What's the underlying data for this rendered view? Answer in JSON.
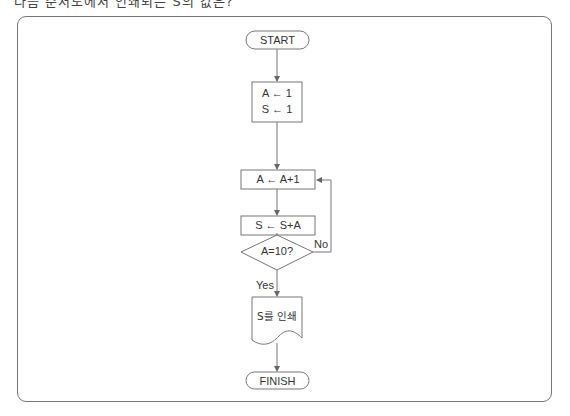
{
  "header": {
    "clipped_text": "다음 순서도에서 인쇄되는 S의 값은?"
  },
  "flowchart": {
    "start": {
      "label": "START"
    },
    "init": {
      "line1": "A ← 1",
      "line2": "S ← 1"
    },
    "increment": {
      "label": "A ← A+1"
    },
    "accumulate": {
      "label": "S ← S+A"
    },
    "decision": {
      "label": "A=10?",
      "yes_label": "Yes",
      "no_label": "No"
    },
    "output": {
      "label": "S를 인쇄"
    },
    "finish": {
      "label": "FINISH"
    }
  },
  "colors": {
    "stroke": "#777777",
    "text": "#333333",
    "background": "#ffffff"
  }
}
